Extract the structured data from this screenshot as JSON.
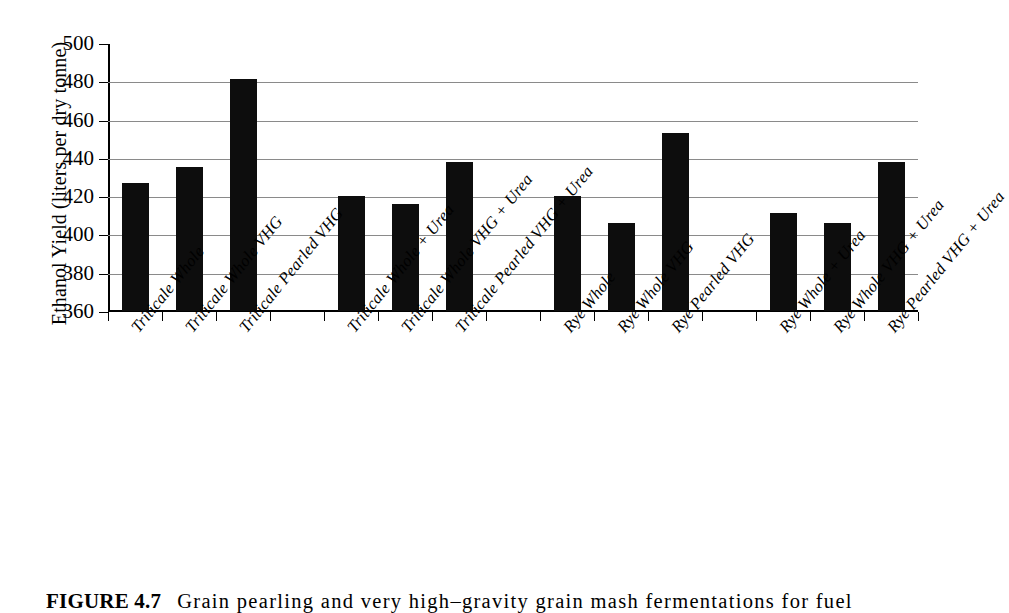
{
  "figure": {
    "caption_label": "FIGURE 4.7",
    "caption_text": "Grain pearling and very high–gravity grain mash fermentations for fuel"
  },
  "chart_data": {
    "type": "bar",
    "title": "",
    "xlabel": "",
    "ylabel": "Ethanol Yield (liters per dry tonne)",
    "ylim": [
      360,
      500
    ],
    "ytick_step": 20,
    "yticks": [
      360,
      380,
      400,
      420,
      440,
      460,
      480,
      500
    ],
    "grid": true,
    "legend": "none",
    "bar_color": "#0d0d0d",
    "group_gap_after": [
      3,
      6,
      9
    ],
    "categories": [
      "Triticale Whole",
      "Triticale Whole VHG",
      "Triticale Pearled VHG",
      "Triticale Whole + Urea",
      "Triticale Whole VHG + Urea",
      "Triticale Pearled VHG + Urea",
      "Rye Whole",
      "Rye Whole VHG",
      "Rye Pearled VHG",
      "Rye Whole + Urea",
      "Rye Whole VHG + Urea",
      "Rye Pearled VHG + Urea"
    ],
    "values": [
      427,
      435,
      481,
      420,
      416,
      438,
      420,
      406,
      453,
      411,
      406,
      438
    ]
  }
}
